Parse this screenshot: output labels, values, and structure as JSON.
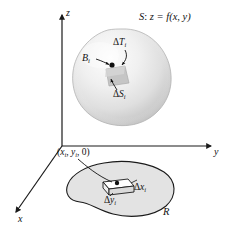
{
  "figure": {
    "background_color": "#ffffff",
    "width": 227,
    "height": 237
  },
  "axes": {
    "z_label": "z",
    "y_label": "y",
    "x_label": "x",
    "origin": {
      "x": 62,
      "y": 146
    },
    "color": "#1a1a1a"
  },
  "surface": {
    "label_prefix": "S",
    "label_colon": ":",
    "label_equation": "z = f(x, y)",
    "full_label": "S: z = f(x, y)",
    "fill_light": "#f5f5f5",
    "fill_mid": "#dcdcdc",
    "fill_dark": "#b9b9b9",
    "outline_color": "#9a9a9a"
  },
  "surface_annotations": {
    "point_label": "B",
    "point_subscript": "i",
    "tangent_patch_label": "T",
    "tangent_patch_delta": "Δ",
    "tangent_patch_subscript": "i",
    "surface_patch_label": "S",
    "surface_patch_delta": "Δ",
    "surface_patch_subscript": "i"
  },
  "region": {
    "label": "R",
    "fill_color": "#e2e2e2",
    "outline_color": "#1a1a1a",
    "point_label_open": "(",
    "point_label_text": "x",
    "point_subscript": "i",
    "point_label_full": "(x i , y i , 0)",
    "point_parts": {
      "open": "(",
      "x": "x",
      "sub1": "i",
      "comma1": ", ",
      "y": "y",
      "sub2": "i",
      "comma2": ", ",
      "zero": "0",
      "close": ")"
    },
    "dx_delta": "Δ",
    "dx_label": "x",
    "dx_subscript": "i",
    "dy_delta": "Δ",
    "dy_label": "y",
    "dy_subscript": "i"
  }
}
